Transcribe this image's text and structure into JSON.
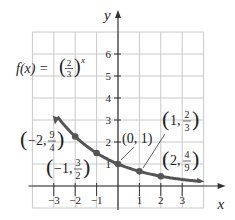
{
  "chart_data": {
    "type": "line",
    "function_label": {
      "prefix": "f(x) = ",
      "base_num": "2",
      "base_den": "3",
      "exponent": "x"
    },
    "xlabel": "x",
    "ylabel": "y",
    "xlim": [
      -4,
      4
    ],
    "ylim": [
      -1,
      7
    ],
    "x_ticks": [
      "-3",
      "-2",
      "-1",
      "1",
      "2",
      "3"
    ],
    "y_ticks": [
      "1",
      "2",
      "3",
      "4",
      "5",
      "6"
    ],
    "grid": true,
    "points": [
      {
        "x": -2,
        "y": 2.25,
        "label": "(-2, 9/4)"
      },
      {
        "x": -1,
        "y": 1.5,
        "label": "(-1, 3/2)"
      },
      {
        "x": 0,
        "y": 1,
        "label": "(0, 1)"
      },
      {
        "x": 1,
        "y": 0.667,
        "label": "(1, 2/3)"
      },
      {
        "x": 2,
        "y": 0.444,
        "label": "(2, 4/9)"
      }
    ],
    "curve_color": "#555555",
    "grid_color": "#c8c8c8"
  }
}
